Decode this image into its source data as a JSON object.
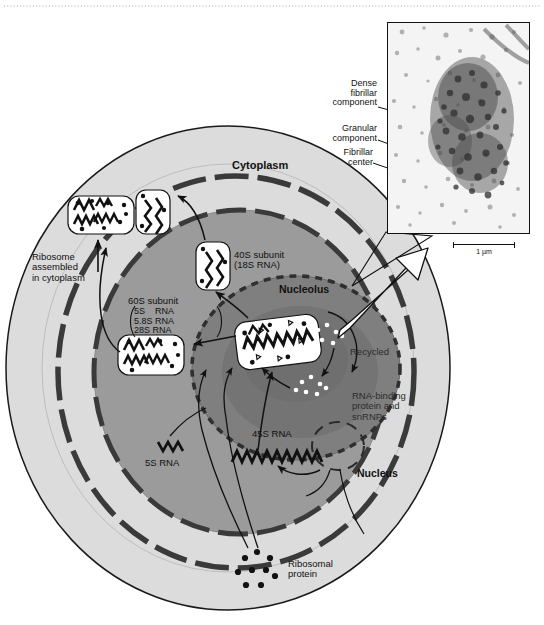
{
  "figure": {
    "compartments": {
      "cytoplasm": "Cytoplasm",
      "nucleus": "Nucleus",
      "nucleolus": "Nucleolus"
    },
    "labels": {
      "ribosome_assembled": "Ribosome\nassembled\nin cytoplasm",
      "subunit_40s": "40S subunit\n(18S RNA)",
      "subunit_60s_title": "60S subunit",
      "subunit_60s_rna": "5S    RNA\n5.8S RNA\n28S RNA",
      "rna_45s": "45S RNA",
      "rna_5s": "5S RNA",
      "ribosomal_protein": "Ribosomal\nprotein",
      "recycled": "Recycled",
      "rna_binding": "RNA-binding\nprotein and\nsnRNPs"
    },
    "micrograph": {
      "callouts": [
        {
          "id": "dense-fibrillar-component",
          "text": "Dense\nfibrillar\ncomponent"
        },
        {
          "id": "granular-component",
          "text": "Granular\ncomponent"
        },
        {
          "id": "fibrillar-center",
          "text": "Fibrillar\ncenter"
        }
      ],
      "scale_bar_label": "1 µm"
    },
    "colors": {
      "cytoplasm_fill": "#dcdcdc",
      "nucleoplasm_fill": "#9b9b9b",
      "nucleolus_fill": "#7f7f7f",
      "nucleolus_core_fill": "#6f6f6f",
      "membrane_stroke": "#1a1a1a",
      "subunit_fill": "#ffffff",
      "text": "#111111"
    }
  }
}
